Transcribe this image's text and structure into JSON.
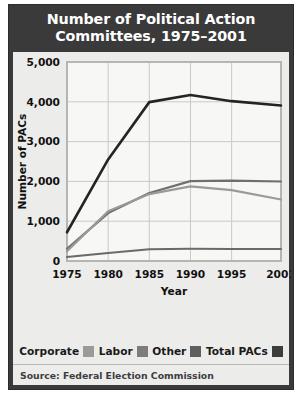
{
  "figure": {
    "title_lines": [
      "Number of Political Action",
      "Committees, 1975–2001"
    ],
    "source": "Source: Federal Election Commission",
    "frame_color": "#3a3a3a",
    "panel_color": "#ececea",
    "plot_color": "#f7f7f5"
  },
  "legend": {
    "position": "bottom",
    "items": [
      {
        "label": "Corporate",
        "color": "#9a9a9a"
      },
      {
        "label": "Labor",
        "color": "#7d7d7d"
      },
      {
        "label": "Other",
        "color": "#5e5e5e"
      },
      {
        "label": "Total PACs",
        "color": "#3d3d3d"
      }
    ]
  },
  "chart_data": {
    "type": "line",
    "title": "Number of Political Action Committees, 1975–2001",
    "xlabel": "Year",
    "ylabel": "Number of PACs",
    "x": [
      1975,
      1980,
      1985,
      1990,
      1995,
      2001
    ],
    "xlim": [
      1975,
      2001
    ],
    "xtick_labels": [
      "1975",
      "1980",
      "1985",
      "1990",
      "1995",
      "2001"
    ],
    "ylim": [
      0,
      5000
    ],
    "yticks": [
      0,
      1000,
      2000,
      3000,
      4000,
      5000
    ],
    "ytick_labels": [
      "0",
      "1,000",
      "2,000",
      "3,000",
      "4,000",
      "5,000"
    ],
    "grid": true,
    "legend_position": "bottom",
    "series": [
      {
        "name": "Total PACs",
        "color": "#242424",
        "width": 2.6,
        "values": [
          722,
          2551,
          3992,
          4172,
          4016,
          3907
        ]
      },
      {
        "name": "Labor",
        "color": "#6f6f6f",
        "width": 2.2,
        "values": [
          305,
          1204,
          1710,
          2008,
          2018,
          1998
        ]
      },
      {
        "name": "Corporate",
        "color": "#9a9a9a",
        "width": 2.2,
        "values": [
          245,
          1251,
          1682,
          1875,
          1780,
          1545
        ]
      },
      {
        "name": "Other",
        "color": "#6a6a6a",
        "width": 2.0,
        "values": [
          100,
          200,
          295,
          305,
          303,
          300
        ]
      }
    ]
  }
}
